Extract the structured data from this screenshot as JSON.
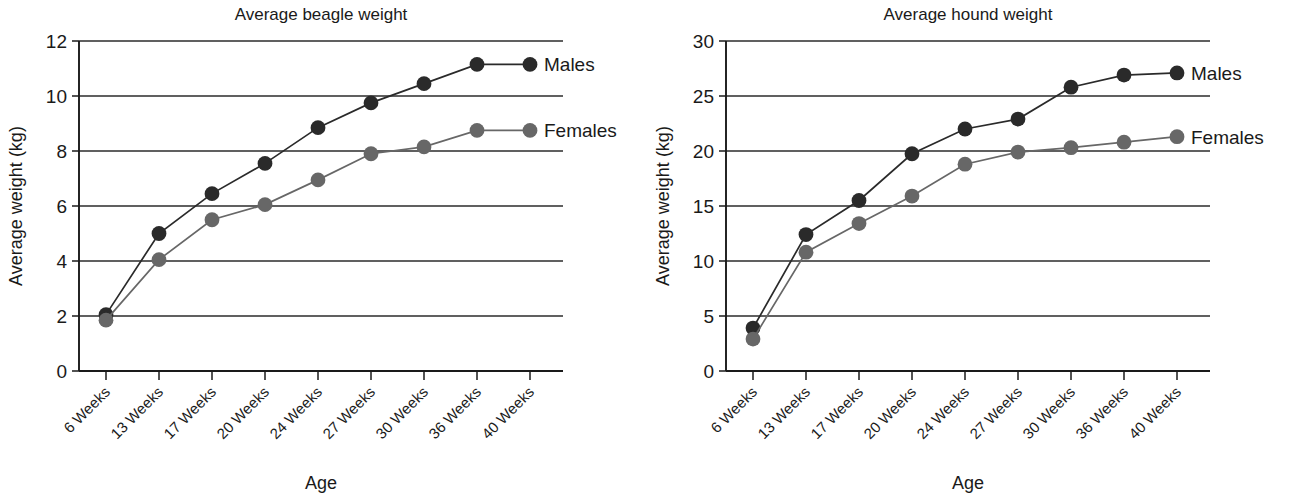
{
  "figure": {
    "panels": [
      "left",
      "right"
    ]
  },
  "chart_data": [
    {
      "type": "line",
      "title": "Average beagle weight",
      "xlabel": "Age",
      "ylabel": "Average weight (kg)",
      "categories": [
        "6 Weeks",
        "13 Weeks",
        "17 Weeks",
        "20 Weeks",
        "24 Weeks",
        "27 Weeks",
        "30 Weeks",
        "36 Weeks",
        "40 Weeks"
      ],
      "ylim": [
        0,
        12
      ],
      "yticks": [
        0,
        2,
        4,
        6,
        8,
        10,
        12
      ],
      "grid": true,
      "legend_position": "right-of-plot-inline",
      "series": [
        {
          "name": "Males",
          "color": "#2a2a2a",
          "values": [
            2.05,
            5.0,
            6.45,
            7.55,
            8.85,
            9.75,
            10.45,
            11.15,
            11.15
          ]
        },
        {
          "name": "Females",
          "color": "#676767",
          "values": [
            1.85,
            4.05,
            5.5,
            6.05,
            6.95,
            7.9,
            8.15,
            8.75,
            8.75
          ]
        }
      ]
    },
    {
      "type": "line",
      "title": "Average hound weight",
      "xlabel": "Age",
      "ylabel": "Average weight (kg)",
      "categories": [
        "6 Weeks",
        "13 Weeks",
        "17 Weeks",
        "20 Weeks",
        "24 Weeks",
        "27 Weeks",
        "30 Weeks",
        "36 Weeks",
        "40 Weeks"
      ],
      "ylim": [
        0,
        30
      ],
      "yticks": [
        0,
        5,
        10,
        15,
        20,
        25,
        30
      ],
      "grid": true,
      "legend_position": "right-of-plot-inline",
      "series": [
        {
          "name": "Males",
          "color": "#2a2a2a",
          "values": [
            3.9,
            12.4,
            15.5,
            19.75,
            22.0,
            22.9,
            25.8,
            26.9,
            27.1
          ]
        },
        {
          "name": "Females",
          "color": "#676767",
          "values": [
            2.9,
            10.8,
            13.4,
            15.9,
            18.8,
            19.9,
            20.3,
            20.8,
            21.3
          ]
        }
      ]
    }
  ]
}
